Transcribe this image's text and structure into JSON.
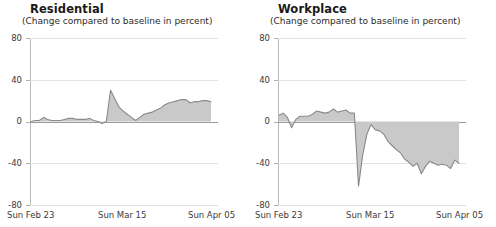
{
  "page": {
    "background": "#ffffff",
    "accent_fill": "#c9c9c9",
    "accent_stroke": "#8a8a8a",
    "grid_color": "#e2e2e2",
    "axis_color": "#b9b9b9"
  },
  "panels": [
    {
      "id": "residential",
      "title": "Residential",
      "subtitle": "(Change compared to baseline in percent)"
    },
    {
      "id": "workplace",
      "title": "Workplace",
      "subtitle": "(Change compared to baseline in percent)"
    }
  ],
  "axis": {
    "y_ticks": [
      "80",
      "40",
      "0",
      "-40",
      "-80"
    ],
    "x_ticks": [
      "Sun Feb 23",
      "Sun Mar 15",
      "Sun Apr 05"
    ]
  },
  "chart_data": [
    {
      "type": "area",
      "title": "Residential",
      "subtitle": "(Change compared to baseline in percent)",
      "xlabel": "",
      "ylabel": "Change compared to baseline in percent",
      "ylim": [
        -80,
        80
      ],
      "ytick_values": [
        80,
        40,
        0,
        -40,
        -80
      ],
      "grid": true,
      "legend": "none",
      "x": [
        "Sun Feb 23",
        "Mon Feb 24",
        "Tue Feb 25",
        "Wed Feb 26",
        "Thu Feb 27",
        "Fri Feb 28",
        "Sat Feb 29",
        "Sun Mar 01",
        "Mon Mar 02",
        "Tue Mar 03",
        "Wed Mar 04",
        "Thu Mar 05",
        "Fri Mar 06",
        "Sat Mar 07",
        "Sun Mar 08",
        "Mon Mar 09",
        "Tue Mar 10",
        "Wed Mar 11",
        "Thu Mar 12",
        "Fri Mar 13",
        "Sat Mar 14",
        "Sun Mar 15",
        "Mon Mar 16",
        "Tue Mar 17",
        "Wed Mar 18",
        "Thu Mar 19",
        "Fri Mar 20",
        "Sat Mar 21",
        "Sun Mar 22",
        "Mon Mar 23",
        "Tue Mar 24",
        "Wed Mar 25",
        "Thu Mar 26",
        "Fri Mar 27",
        "Sat Mar 28",
        "Sun Mar 29",
        "Mon Mar 30",
        "Tue Mar 31",
        "Wed Apr 01",
        "Thu Apr 02",
        "Fri Apr 03",
        "Sat Apr 04",
        "Sun Apr 05",
        "Mon Apr 06"
      ],
      "values": [
        0,
        1,
        1,
        4,
        2,
        1,
        1,
        1,
        2,
        3,
        3,
        2,
        2,
        2,
        3,
        1,
        0,
        -2,
        0,
        30,
        22,
        14,
        10,
        7,
        4,
        1,
        4,
        7,
        8,
        9,
        11,
        13,
        16,
        18,
        19,
        20,
        21,
        21,
        18,
        19,
        19,
        20,
        20,
        19
      ],
      "ylim_note": "axis spans -80 to 80 in steps of 40"
    },
    {
      "type": "area",
      "title": "Workplace",
      "subtitle": "(Change compared to baseline in percent)",
      "xlabel": "",
      "ylabel": "Change compared to baseline in percent",
      "ylim": [
        -80,
        80
      ],
      "ytick_values": [
        80,
        40,
        0,
        -40,
        -80
      ],
      "grid": true,
      "legend": "none",
      "x": [
        "Sun Feb 23",
        "Mon Feb 24",
        "Tue Feb 25",
        "Wed Feb 26",
        "Thu Feb 27",
        "Fri Feb 28",
        "Sat Feb 29",
        "Sun Mar 01",
        "Mon Mar 02",
        "Tue Mar 03",
        "Wed Mar 04",
        "Thu Mar 05",
        "Fri Mar 06",
        "Sat Mar 07",
        "Sun Mar 08",
        "Mon Mar 09",
        "Tue Mar 10",
        "Wed Mar 11",
        "Thu Mar 12",
        "Fri Mar 13",
        "Sat Mar 14",
        "Sun Mar 15",
        "Mon Mar 16",
        "Tue Mar 17",
        "Wed Mar 18",
        "Thu Mar 19",
        "Fri Mar 20",
        "Sat Mar 21",
        "Sun Mar 22",
        "Mon Mar 23",
        "Tue Mar 24",
        "Wed Mar 25",
        "Thu Mar 26",
        "Fri Mar 27",
        "Sat Mar 28",
        "Sun Mar 29",
        "Mon Mar 30",
        "Tue Mar 31",
        "Wed Apr 01",
        "Thu Apr 02",
        "Fri Apr 03",
        "Sat Apr 04",
        "Sun Apr 05",
        "Mon Apr 06"
      ],
      "values": [
        6,
        8,
        4,
        -6,
        2,
        5,
        5,
        5,
        7,
        10,
        9,
        8,
        9,
        12,
        9,
        10,
        11,
        8,
        8,
        -62,
        -32,
        -12,
        -3,
        -8,
        -9,
        -12,
        -19,
        -23,
        -27,
        -30,
        -36,
        -39,
        -43,
        -40,
        -50,
        -43,
        -38,
        -40,
        -42,
        -41,
        -42,
        -45,
        -37,
        -40
      ],
      "ylim_note": "axis spans -80 to 80 in steps of 40"
    }
  ]
}
